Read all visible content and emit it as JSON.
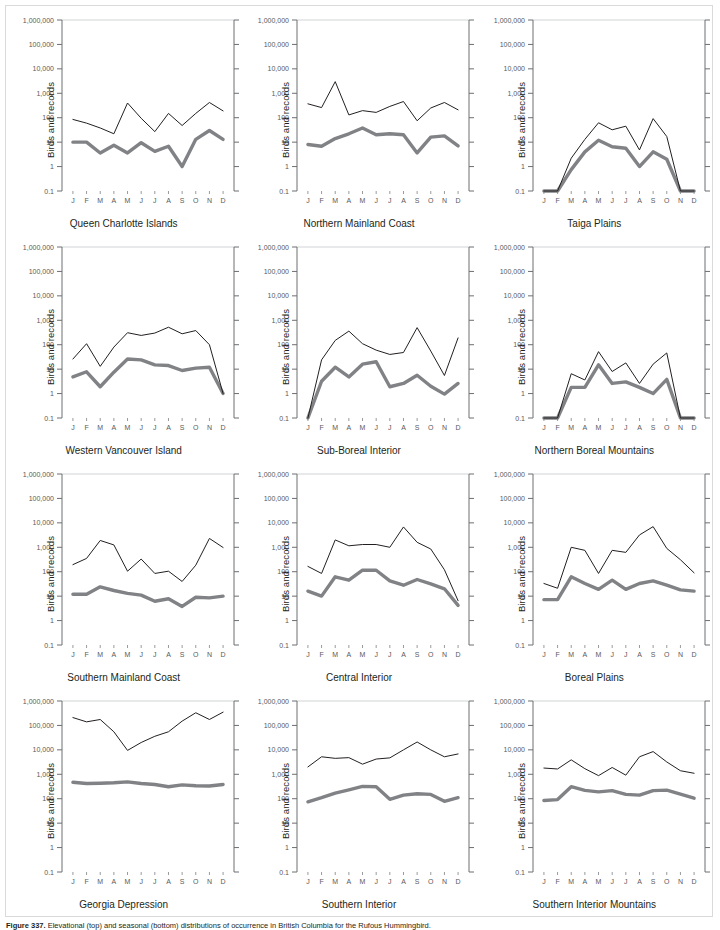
{
  "figure": {
    "caption_label": "Figure 337.",
    "caption_text": "Elevational (top) and seasonal (bottom) distributions of occurrence in British Columbia for the Rufous Hummingbird.",
    "border_color": "#d9dadb"
  },
  "axes": {
    "ylabel": "Birds and records",
    "y_tick_labels": [
      "1,000,000",
      "100,000",
      "10,000",
      "1,000",
      "100",
      "10",
      "1",
      "0.1"
    ],
    "y_tick_values": [
      1000000,
      100000,
      10000,
      1000,
      100,
      10,
      1,
      0.1
    ],
    "x_tick_labels": [
      "J",
      "F",
      "M",
      "A",
      "M",
      "J",
      "J",
      "A",
      "S",
      "O",
      "N",
      "D"
    ],
    "ylim": [
      0.1,
      1000000
    ],
    "grid": "top-line-only",
    "legend": "none"
  },
  "style": {
    "black_line_color": "#231f20",
    "gray_line_color": "#808285",
    "axis_color": "#6d6e71",
    "grid_color": "#d1d3d4"
  },
  "chart_data": [
    {
      "type": "line",
      "title": "Queen Charlotte Islands",
      "xlabel": "",
      "ylabel": "Birds and records",
      "ylim": [
        0.1,
        1000000
      ],
      "categories": [
        "J",
        "F",
        "M",
        "A",
        "M",
        "J",
        "J",
        "A",
        "S",
        "O",
        "N",
        "D"
      ],
      "series": [
        {
          "name": "records",
          "values": [
            85,
            60,
            38,
            22,
            400,
            95,
            27,
            150,
            48,
            150,
            420,
            190
          ]
        },
        {
          "name": "birds",
          "values": [
            10,
            10,
            3.6,
            7.5,
            3.6,
            9.5,
            4.2,
            6.8,
            1.0,
            13,
            30,
            13
          ]
        }
      ]
    },
    {
      "type": "line",
      "title": "Northern Mainland Coast",
      "xlabel": "",
      "ylabel": "Birds and records",
      "ylim": [
        0.1,
        1000000
      ],
      "categories": [
        "J",
        "F",
        "M",
        "A",
        "M",
        "J",
        "J",
        "A",
        "S",
        "O",
        "N",
        "D"
      ],
      "series": [
        {
          "name": "records",
          "values": [
            370,
            260,
            3000,
            130,
            195,
            165,
            290,
            460,
            75,
            250,
            420,
            210
          ]
        },
        {
          "name": "birds",
          "values": [
            8,
            6.8,
            14,
            22,
            38,
            20,
            22,
            20,
            3.6,
            16,
            18,
            7
          ]
        }
      ]
    },
    {
      "type": "line",
      "title": "Taiga Plains",
      "xlabel": "",
      "ylabel": "Birds and records",
      "ylim": [
        0.1,
        1000000
      ],
      "categories": [
        "J",
        "F",
        "M",
        "A",
        "M",
        "J",
        "J",
        "A",
        "S",
        "O",
        "N",
        "D"
      ],
      "series": [
        {
          "name": "records",
          "values": [
            0.1,
            0.1,
            2.2,
            13,
            62,
            32,
            45,
            4.8,
            92,
            17,
            0.1,
            0.1
          ]
        },
        {
          "name": "birds",
          "values": [
            0.1,
            0.1,
            0.75,
            4.0,
            12,
            6.5,
            5.6,
            1.0,
            4.0,
            2.0,
            0.1,
            0.1
          ]
        }
      ]
    },
    {
      "type": "line",
      "title": "Western Vancouver Island",
      "xlabel": "",
      "ylabel": "Birds and records",
      "ylim": [
        0.1,
        1000000
      ],
      "categories": [
        "J",
        "F",
        "M",
        "A",
        "M",
        "J",
        "J",
        "A",
        "S",
        "O",
        "N",
        "D"
      ],
      "series": [
        {
          "name": "records",
          "values": [
            26,
            110,
            13,
            80,
            310,
            240,
            300,
            520,
            280,
            380,
            100,
            1.0
          ]
        },
        {
          "name": "birds",
          "values": [
            4.8,
            7.8,
            1.9,
            7.5,
            26,
            24,
            15,
            14,
            8.8,
            11,
            12,
            1.0
          ]
        }
      ]
    },
    {
      "type": "line",
      "title": "Sub-Boreal Interior",
      "xlabel": "",
      "ylabel": "Birds and records",
      "ylim": [
        0.1,
        1000000
      ],
      "categories": [
        "J",
        "F",
        "M",
        "A",
        "M",
        "J",
        "J",
        "A",
        "S",
        "O",
        "N",
        "D"
      ],
      "series": [
        {
          "name": "records",
          "values": [
            0.1,
            24,
            150,
            360,
            110,
            60,
            40,
            48,
            500,
            55,
            5.5,
            190
          ]
        },
        {
          "name": "birds",
          "values": [
            0.1,
            3.2,
            12,
            4.8,
            16,
            20,
            1.9,
            2.6,
            5.6,
            2.0,
            0.95,
            2.6
          ]
        }
      ]
    },
    {
      "type": "line",
      "title": "Northern Boreal Mountains",
      "xlabel": "",
      "ylabel": "Birds and records",
      "ylim": [
        0.1,
        1000000
      ],
      "categories": [
        "J",
        "F",
        "M",
        "A",
        "M",
        "J",
        "J",
        "A",
        "S",
        "O",
        "N",
        "D"
      ],
      "series": [
        {
          "name": "records",
          "values": [
            0.1,
            0.1,
            6.5,
            3.6,
            52,
            8.0,
            18,
            2.6,
            16,
            46,
            0.1,
            0.1
          ]
        },
        {
          "name": "birds",
          "values": [
            0.1,
            0.1,
            1.8,
            1.8,
            15,
            2.6,
            3.0,
            1.8,
            1.0,
            3.8,
            0.1,
            0.1
          ]
        }
      ]
    },
    {
      "type": "line",
      "title": "Southern Mainland Coast",
      "xlabel": "",
      "ylabel": "Birds and records",
      "ylim": [
        0.1,
        1000000
      ],
      "categories": [
        "J",
        "F",
        "M",
        "A",
        "M",
        "J",
        "J",
        "A",
        "S",
        "O",
        "N",
        "D"
      ],
      "series": [
        {
          "name": "records",
          "values": [
            195,
            350,
            1900,
            1250,
            105,
            330,
            85,
            105,
            40,
            185,
            2300,
            980
          ]
        },
        {
          "name": "birds",
          "values": [
            12,
            12,
            24,
            17,
            13,
            11,
            6.2,
            7.8,
            3.8,
            9,
            8.5,
            10
          ]
        }
      ]
    },
    {
      "type": "line",
      "title": "Central Interior",
      "xlabel": "",
      "ylabel": "Birds and records",
      "ylim": [
        0.1,
        1000000
      ],
      "categories": [
        "J",
        "F",
        "M",
        "A",
        "M",
        "J",
        "J",
        "A",
        "S",
        "O",
        "N",
        "D"
      ],
      "series": [
        {
          "name": "records",
          "values": [
            165,
            85,
            2000,
            1150,
            1300,
            1300,
            1000,
            6800,
            1600,
            850,
            120,
            6.5
          ]
        },
        {
          "name": "birds",
          "values": [
            16,
            10,
            62,
            45,
            115,
            115,
            42,
            28,
            48,
            32,
            20,
            4.2
          ]
        }
      ]
    },
    {
      "type": "line",
      "title": "Boreal Plains",
      "xlabel": "",
      "ylabel": "Birds and records",
      "ylim": [
        0.1,
        1000000
      ],
      "categories": [
        "J",
        "F",
        "M",
        "A",
        "M",
        "J",
        "J",
        "A",
        "S",
        "O",
        "N",
        "D"
      ],
      "series": [
        {
          "name": "records",
          "values": [
            33,
            21,
            1000,
            750,
            85,
            750,
            620,
            3200,
            7000,
            900,
            310,
            90
          ]
        },
        {
          "name": "birds",
          "values": [
            7.2,
            7.2,
            62,
            33,
            19,
            45,
            19,
            33,
            42,
            28,
            18,
            16
          ]
        }
      ]
    },
    {
      "type": "line",
      "title": "Georgia Depression",
      "xlabel": "",
      "ylabel": "Birds and records",
      "ylim": [
        0.1,
        1000000
      ],
      "categories": [
        "J",
        "F",
        "M",
        "A",
        "M",
        "J",
        "J",
        "A",
        "S",
        "O",
        "N",
        "D"
      ],
      "series": [
        {
          "name": "records",
          "values": [
            210000,
            140000,
            175000,
            55000,
            9500,
            20000,
            36000,
            55000,
            150000,
            330000,
            175000,
            350000
          ]
        },
        {
          "name": "birds",
          "values": [
            470,
            420,
            430,
            450,
            490,
            420,
            380,
            310,
            370,
            340,
            330,
            380
          ]
        }
      ]
    },
    {
      "type": "line",
      "title": "Southern Interior",
      "xlabel": "",
      "ylabel": "Birds and records",
      "ylim": [
        0.1,
        1000000
      ],
      "categories": [
        "J",
        "F",
        "M",
        "A",
        "M",
        "J",
        "J",
        "A",
        "S",
        "O",
        "N",
        "D"
      ],
      "series": [
        {
          "name": "records",
          "values": [
            2000,
            5200,
            4500,
            4800,
            2600,
            4200,
            4700,
            10000,
            21000,
            10000,
            5200,
            6800
          ]
        },
        {
          "name": "birds",
          "values": [
            75,
            110,
            170,
            230,
            320,
            310,
            95,
            140,
            160,
            150,
            78,
            110
          ]
        }
      ]
    },
    {
      "type": "line",
      "title": "Southern Interior Mountains",
      "xlabel": "",
      "ylabel": "Birds and records",
      "ylim": [
        0.1,
        1000000
      ],
      "categories": [
        "J",
        "F",
        "M",
        "A",
        "M",
        "J",
        "J",
        "A",
        "S",
        "O",
        "N",
        "D"
      ],
      "series": [
        {
          "name": "records",
          "values": [
            1800,
            1650,
            3900,
            1700,
            880,
            1900,
            920,
            5200,
            8500,
            3200,
            1400,
            1100
          ]
        },
        {
          "name": "birds",
          "values": [
            85,
            92,
            310,
            220,
            190,
            215,
            150,
            140,
            215,
            225,
            155,
            105
          ]
        }
      ]
    }
  ]
}
